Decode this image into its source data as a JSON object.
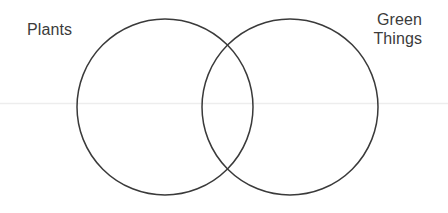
{
  "diagram": {
    "type": "venn",
    "title": "",
    "background_color": "#ffffff",
    "stroke_color": "#3a3a3a",
    "stroke_width": 1.5,
    "text_color": "#3b3b3b",
    "scan_line_color": "#ededed",
    "sets": [
      {
        "id": "plants",
        "label": "Plants",
        "label_position": "top-left",
        "cx": 165,
        "cy": 107,
        "r": 88
      },
      {
        "id": "green-things",
        "label": "Green\nThings",
        "label_position": "top-right",
        "cx": 290,
        "cy": 107,
        "r": 88
      }
    ],
    "intersection": {
      "label": "",
      "top_point": {
        "x": 227,
        "y": 42
      },
      "bottom_point": {
        "x": 227,
        "y": 172
      }
    }
  }
}
